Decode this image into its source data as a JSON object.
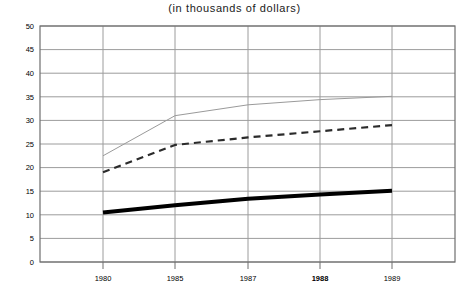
{
  "chart_data": {
    "type": "line",
    "title": "(in thousands of dollars)",
    "xlabel": "",
    "ylabel": "",
    "x": [
      1980,
      1985,
      1987,
      1988,
      1989
    ],
    "x_tick_labels": [
      "1980",
      "1985",
      "1987",
      "1988",
      "1989"
    ],
    "x_tick_emphasis": [
      false,
      false,
      false,
      true,
      false
    ],
    "ylim": [
      0,
      50
    ],
    "y_ticks": [
      0,
      5,
      10,
      15,
      20,
      25,
      30,
      35,
      40,
      45,
      50
    ],
    "y_tick_labels": [
      "0",
      "5",
      "10",
      "15",
      "20",
      "25",
      "30",
      "35",
      "40",
      "45",
      "50"
    ],
    "grid": true,
    "legend": "none",
    "series": [
      {
        "name": "upper-series",
        "style": "solid-thin-gray",
        "color": "#9a9a9a",
        "width": 1,
        "values": [
          22.5,
          31.0,
          33.3,
          34.4,
          35.1
        ]
      },
      {
        "name": "middle-series",
        "style": "dashed",
        "color": "#2b2b2b",
        "width": 2.2,
        "dash": "7,5",
        "values": [
          19.0,
          24.8,
          26.4,
          27.7,
          29.0
        ]
      },
      {
        "name": "lower-series",
        "style": "solid-thick-black",
        "color": "#000000",
        "width": 4,
        "values": [
          10.5,
          12.0,
          13.4,
          14.3,
          15.1
        ]
      }
    ]
  },
  "plot_geometry": {
    "left": 40,
    "right": 455,
    "top": 26,
    "bottom": 262,
    "x_tick_positions": [
      103,
      175,
      248,
      320,
      392
    ],
    "frame_color": "#6e6e6e",
    "grid_color": "#9c9c9c"
  }
}
